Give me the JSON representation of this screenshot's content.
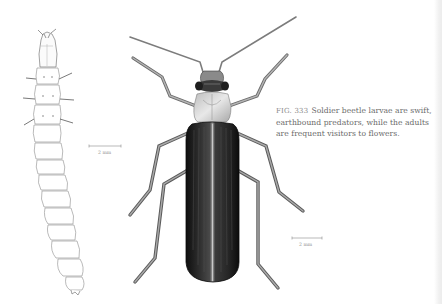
{
  "figure": {
    "number_label": "FIG. 333",
    "caption_text": "Soldier beetle larvae are swift, earthbound predators, while the adults are frequent visitors to flowers.",
    "caption_lines": [
      "Soldier beetle larvae are swift,",
      "earthbound predators, while the adults",
      "are frequent visitors to flowers."
    ]
  },
  "illustrations": [
    {
      "name": "soldier-beetle-larva",
      "style": "pencil line drawing",
      "scale_bar_label": "2 mm"
    },
    {
      "name": "soldier-beetle-adult",
      "style": "shaded illustration",
      "scale_bar_label": "2 mm"
    }
  ],
  "colors": {
    "background": "#ffffff",
    "caption_text": "#6a6a6a",
    "elytra": "#1c1c1c",
    "pronotum": "#d4d4d4",
    "legs": "#8a8a8a",
    "larva_line": "#9a9a9a"
  }
}
